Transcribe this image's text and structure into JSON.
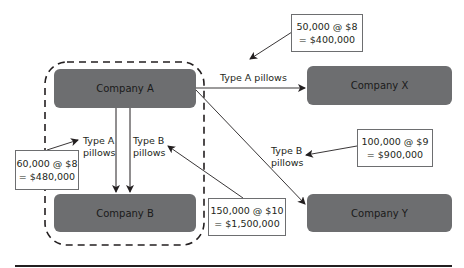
{
  "diagram": {
    "companies": {
      "a": "Company A",
      "b": "Company B",
      "x": "Company X",
      "y": "Company Y"
    },
    "flows": {
      "a_to_x": {
        "label": "Type A pillows"
      },
      "a_to_y": {
        "label_line1": "Type B",
        "label_line2": "pillows"
      },
      "a_to_b_type_a": {
        "label_line1": "Type A",
        "label_line2": "pillows"
      },
      "a_to_b_type_b": {
        "label_line1": "Type B",
        "label_line2": "pillows"
      }
    },
    "calculations": {
      "a_to_x": {
        "line1": "50,000 @ $8",
        "line2": "= $400,000"
      },
      "a_to_y": {
        "line1": "100,000 @ $9",
        "line2": "= $900,000"
      },
      "a_to_b_type_a": {
        "line1": "60,000 @ $8",
        "line2": "= $480,000"
      },
      "a_to_b_type_b": {
        "line1": "150,000 @ $10",
        "line2": "= $1,500,000"
      }
    },
    "group_boundary": {
      "style": "dashed",
      "encloses": [
        "Company A",
        "Company B"
      ]
    },
    "colors": {
      "company_fill": "#6d6e70",
      "line": "#231f20",
      "box_border": "#6d6e70",
      "background": "#ffffff"
    }
  }
}
